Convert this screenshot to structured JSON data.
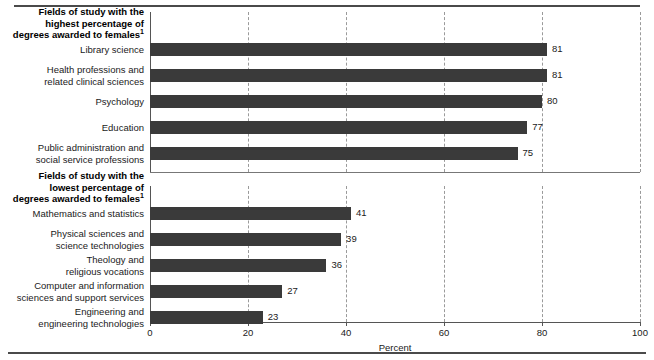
{
  "chart_data": {
    "type": "bar",
    "orientation": "horizontal",
    "title": "",
    "xlabel": "Percent",
    "ylabel": "",
    "xlim": [
      0,
      100
    ],
    "xticks": [
      "0",
      "20",
      "40",
      "60",
      "80",
      "100"
    ],
    "xtick_values": [
      0,
      20,
      40,
      60,
      80,
      100
    ],
    "grid": "vertical-dashed",
    "legend": "none",
    "bar_color": "#3a3a3a",
    "panels": [
      {
        "heading": "Fields of study with the\nhighest percentage of\ndegrees awarded to females",
        "heading_footnote": "1",
        "categories": [
          "Library science",
          "Health professions and\nrelated clinical sciences",
          "Psychology",
          "Education",
          "Public administration and\nsocial service professions"
        ],
        "values": [
          81,
          81,
          80,
          77,
          75
        ],
        "value_labels": [
          "81",
          "81",
          "80",
          "77",
          "75"
        ]
      },
      {
        "heading": "Fields of study with the\nlowest percentage of\ndegrees awarded to females",
        "heading_footnote": "1",
        "categories": [
          "Mathematics and statistics",
          "Physical sciences and\nscience technologies",
          "Theology and\nreligious vocations",
          "Computer and information\nsciences and support services",
          "Engineering and\nengineering technologies"
        ],
        "values": [
          41,
          39,
          36,
          27,
          23
        ],
        "value_labels": [
          "41",
          "39",
          "36",
          "27",
          "23"
        ]
      }
    ]
  }
}
